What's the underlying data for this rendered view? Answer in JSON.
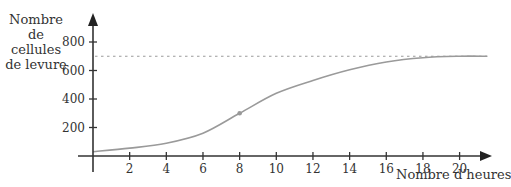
{
  "chart_data": {
    "type": "line",
    "title": "",
    "xlabel": "Nombre d’heures",
    "ylabel": "Nombre de cellules de levure",
    "ylabel_lines": [
      "Nombre de",
      "cellules",
      "de levure"
    ],
    "xlim": [
      0,
      21.5
    ],
    "ylim": [
      0,
      900
    ],
    "x_ticks": [
      2,
      4,
      6,
      8,
      10,
      12,
      14,
      16,
      18,
      20
    ],
    "y_ticks": [
      200,
      400,
      600,
      800
    ],
    "grid": false,
    "legend": null,
    "series": [
      {
        "name": "cellules de levure",
        "color": "#9a9a9a",
        "x": [
          0,
          2,
          4,
          6,
          8,
          10,
          12,
          14,
          16,
          18,
          20,
          21.5
        ],
        "y": [
          30,
          55,
          90,
          160,
          300,
          440,
          530,
          605,
          660,
          690,
          700,
          700
        ]
      }
    ],
    "asymptote": {
      "y": 700,
      "style": "dashed",
      "color": "#9a9a9a"
    },
    "highlighted_point": {
      "x": 8,
      "y": 300
    }
  }
}
